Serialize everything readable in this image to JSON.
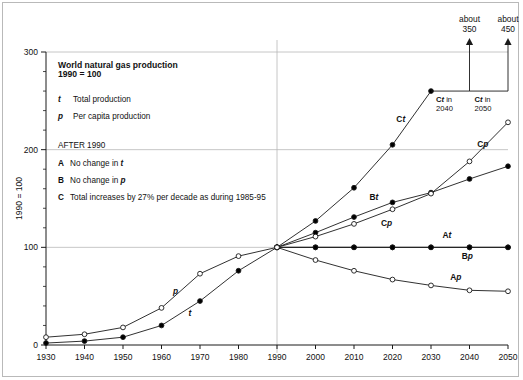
{
  "chart_data": {
    "type": "line",
    "title": "World natural gas production",
    "subtitle": "1990 = 100",
    "ylabel": "1990 = 100",
    "xlabel": "",
    "xlim": [
      1930,
      2050
    ],
    "ylim": [
      0,
      300
    ],
    "yticks": [
      0,
      100,
      200,
      300
    ],
    "yticklabels": [
      "0",
      "100",
      "200",
      "300"
    ],
    "yminor_step": 20,
    "xticks": [
      1930,
      1940,
      1950,
      1960,
      1970,
      1980,
      1990,
      2000,
      2010,
      2020,
      2030,
      2040,
      2050
    ],
    "xticklabels": [
      "1930",
      "1940",
      "1950",
      "1960",
      "1970",
      "1980",
      "1990",
      "2000",
      "2010",
      "2020",
      "2030",
      "2040",
      "2050"
    ],
    "grid": "major gridlines at y=100,200,300 and vertical line at x=1990",
    "legend_position": "inside upper left",
    "marker_legend": [
      {
        "symbol": "t",
        "style": "filled-circle",
        "label": "Total production"
      },
      {
        "symbol": "p",
        "style": "open-circle",
        "label": "Per capita production"
      }
    ],
    "scenario_heading": "AFTER 1990",
    "scenarios": [
      {
        "key": "A",
        "label": "No change in t",
        "label_plain": "No change in ",
        "italic_tail": "t"
      },
      {
        "key": "B",
        "label": "No change in p",
        "label_plain": "No change in ",
        "italic_tail": "p"
      },
      {
        "key": "C",
        "label": "Total increases by 27% per decade as during 1985-95",
        "label_plain": "Total increases by 27% per decade as during 1985-95",
        "italic_tail": ""
      }
    ],
    "series": [
      {
        "name": "t",
        "display": "t",
        "role": "historical-total",
        "marker": "filled-circle",
        "x": [
          1930,
          1940,
          1950,
          1960,
          1970,
          1980,
          1990
        ],
        "values": [
          2,
          4,
          8,
          20,
          45,
          76,
          100
        ]
      },
      {
        "name": "p",
        "display": "p",
        "role": "historical-per-capita",
        "marker": "open-circle",
        "x": [
          1930,
          1940,
          1950,
          1960,
          1970,
          1980,
          1990
        ],
        "values": [
          8,
          11,
          18,
          38,
          73,
          91,
          100
        ]
      },
      {
        "name": "At",
        "display": "At",
        "role": "projection-A-total",
        "marker": "filled-circle",
        "x": [
          1990,
          2000,
          2010,
          2020,
          2030,
          2040,
          2050
        ],
        "values": [
          100,
          100,
          100,
          100,
          100,
          100,
          100
        ]
      },
      {
        "name": "Ap",
        "display": "Ap",
        "role": "projection-A-per-capita",
        "marker": "open-circle",
        "x": [
          1990,
          2000,
          2010,
          2020,
          2030,
          2040,
          2050
        ],
        "values": [
          100,
          87,
          76,
          67,
          61,
          56,
          55
        ]
      },
      {
        "name": "Bt",
        "display": "Bt",
        "role": "projection-B-total",
        "marker": "filled-circle",
        "x": [
          1990,
          2000,
          2010,
          2020,
          2030,
          2040,
          2050
        ],
        "values": [
          100,
          115,
          131,
          146,
          156,
          170,
          183
        ]
      },
      {
        "name": "Bp",
        "display": "Bp",
        "role": "projection-B-per-capita",
        "marker": "filled-circle",
        "x": [
          1990,
          2000,
          2010,
          2020,
          2030,
          2040,
          2050
        ],
        "values": [
          100,
          100,
          100,
          100,
          100,
          100,
          100
        ]
      },
      {
        "name": "Ct",
        "display": "Ct",
        "role": "projection-C-total",
        "marker": "filled-circle",
        "x": [
          1990,
          2000,
          2010,
          2020,
          2030
        ],
        "values": [
          100,
          127,
          161,
          205,
          260
        ]
      },
      {
        "name": "Cp",
        "display": "Cp",
        "role": "projection-C-per-capita",
        "marker": "open-circle",
        "x": [
          1990,
          2000,
          2010,
          2020,
          2030,
          2040,
          2050
        ],
        "values": [
          100,
          111,
          124,
          139,
          155,
          188,
          228
        ]
      }
    ],
    "curve_labels": [
      {
        "name": "t",
        "bold": "",
        "italic": "t",
        "x": 1967,
        "y": 30
      },
      {
        "name": "p",
        "bold": "",
        "italic": "p",
        "x": 1963,
        "y": 52
      },
      {
        "name": "Ct",
        "bold": "C",
        "italic": "t",
        "x": 2021,
        "y": 228
      },
      {
        "name": "Cp",
        "bold": "C",
        "italic": "p",
        "x": 2042,
        "y": 203
      },
      {
        "name": "Bt",
        "bold": "B",
        "italic": "t",
        "x": 2014,
        "y": 148
      },
      {
        "name": "Cp2",
        "bold": "C",
        "italic": "p",
        "x": 2017,
        "y": 122
      },
      {
        "name": "At",
        "bold": "A",
        "italic": "t",
        "x": 2033,
        "y": 110
      },
      {
        "name": "Bp",
        "bold": "B",
        "italic": "p",
        "x": 2038,
        "y": 88
      },
      {
        "name": "Ap",
        "bold": "A",
        "italic": "p",
        "x": 2035,
        "y": 67
      }
    ],
    "annotations": [
      {
        "id": "ct-2040",
        "value_text_line1": "about",
        "value_text_line2": "350",
        "caption_bold": "C",
        "caption_italic": "t",
        "caption_rest": " in",
        "caption_line2": "2040",
        "value": 350,
        "year": 2040
      },
      {
        "id": "ct-2050",
        "value_text_line1": "about",
        "value_text_line2": "450",
        "caption_bold": "C",
        "caption_italic": "t",
        "caption_rest": " in",
        "caption_line2": "2050",
        "value": 450,
        "year": 2050
      }
    ],
    "colors": {
      "line": "#1a1a1a",
      "grid": "#b8b8b8",
      "axis": "#1a1a1a",
      "frame": "#b9b9b9",
      "marker_fill": "#000000",
      "marker_open": "#ffffff",
      "background": "#ffffff"
    }
  }
}
